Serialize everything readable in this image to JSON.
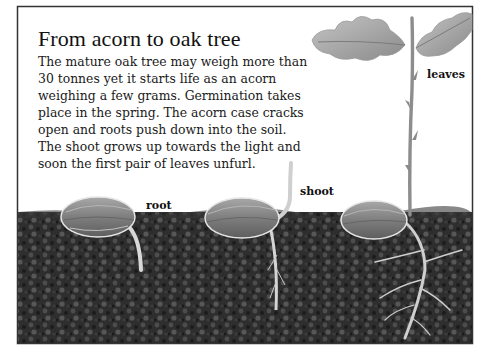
{
  "page": {
    "title": "From acorn to oak tree",
    "body": "The mature oak tree may weigh more than 30 tonnes yet it starts life as an acorn weighing a few grams. Germination takes place in the spring. The acorn case cracks open and roots push down into the soil. The shoot grows up towards the light and soon the first pair of leaves unfurl."
  },
  "illustration": {
    "stages": [
      {
        "name": "root-stage",
        "label": "root"
      },
      {
        "name": "shoot-stage",
        "label": "shoot"
      },
      {
        "name": "leaves-stage",
        "label": "leaves"
      }
    ],
    "colors": {
      "soil": "#2e2e2e",
      "soil_highlight": "#5a5a5a",
      "acorn": "#8a8a8a",
      "acorn_light": "#c8c8c8",
      "root": "#d6d6d6",
      "leaf": "#a9a9a9",
      "stem": "#8d8d8d",
      "frame": "#333333"
    }
  }
}
